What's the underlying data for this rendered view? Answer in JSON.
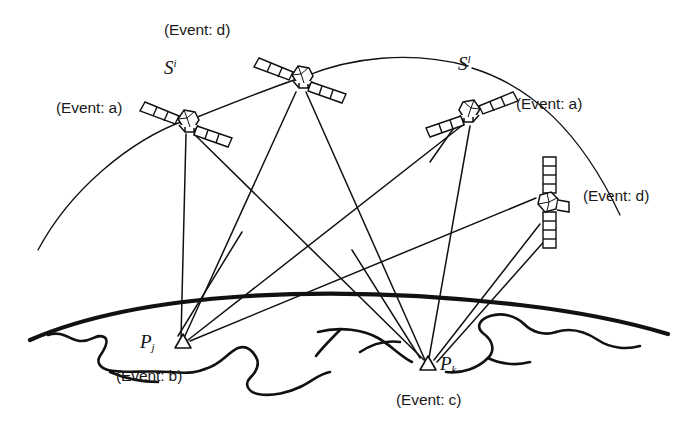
{
  "figure": {
    "type": "technical-diagram",
    "background_color": "#ffffff",
    "ink_color": "#111111"
  },
  "satellites": [
    {
      "id": "sat-left",
      "label": "S",
      "superscript": "i",
      "event_label": "(Event: a)",
      "panel_orientation": "diagonal",
      "x": 188,
      "y": 122
    },
    {
      "id": "sat-top",
      "label": "",
      "superscript": "",
      "event_label": "(Event: d)",
      "panel_orientation": "diagonal",
      "x": 302,
      "y": 78
    },
    {
      "id": "sat-right",
      "label": "S",
      "superscript": "l",
      "event_label": "(Event: a)",
      "panel_orientation": "diagonal",
      "x": 470,
      "y": 112
    },
    {
      "id": "sat-lower-right",
      "label": "",
      "superscript": "",
      "event_label": "(Event: d)",
      "panel_orientation": "vertical",
      "x": 549,
      "y": 203
    }
  ],
  "ground_stations": [
    {
      "id": "station-j",
      "label": "P",
      "subscript": "j",
      "event_label": "(Event: b)",
      "marker": "triangle",
      "x": 183,
      "y": 343
    },
    {
      "id": "station-k",
      "label": "P",
      "subscript": "k",
      "event_label": "(Event: c)",
      "marker": "triangle",
      "x": 428,
      "y": 366
    }
  ],
  "labels": {
    "event_a_left": "(Event: a)",
    "event_a_right": "(Event: a)",
    "event_b": "(Event: b)",
    "event_c": "(Event: c)",
    "event_d_top": "(Event: d)",
    "event_d_right": "(Event: d)",
    "sat_left_symbol": "S",
    "sat_left_sup": "i",
    "sat_right_symbol": "S",
    "sat_right_sup": "l",
    "station_j_symbol": "P",
    "station_j_sub": "j",
    "station_k_symbol": "P",
    "station_k_sub": "k"
  },
  "elements": {
    "earth_limb": "thick-arc",
    "coastline": "wavy-line",
    "orbit_arc_left": "thin-arc",
    "orbit_arc_right": "thin-arc",
    "signal_links": "straight-lines"
  }
}
